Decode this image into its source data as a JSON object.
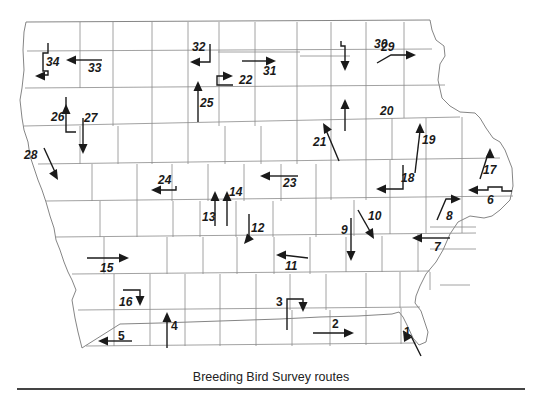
{
  "caption": "Breeding Bird Survey routes",
  "colors": {
    "route": "#1a1a1a",
    "county_line": "#8a8a8a",
    "rule": "#444444"
  },
  "routes": [
    {
      "id": "1",
      "label": "1",
      "label_pos": [
        404,
        336
      ],
      "path": "M421,356 L411,336 L403,331",
      "arrow_at": [
        403,
        331
      ],
      "arrow_dir": "up-left"
    },
    {
      "id": "2",
      "label": "2",
      "label_pos": [
        332,
        328
      ],
      "path": "M313,333 L348,333",
      "arrow_at": [
        354,
        333
      ],
      "arrow_dir": "right"
    },
    {
      "id": "3",
      "label": "3",
      "label_pos": [
        276,
        306
      ],
      "path": "M287,330 L287,299 L303,299 L303,306",
      "arrow_at": [
        303,
        312
      ],
      "arrow_dir": "down"
    },
    {
      "id": "4",
      "label": "4",
      "label_pos": [
        171,
        330
      ],
      "path": "M167,348 L167,318",
      "arrow_at": [
        167,
        312
      ],
      "arrow_dir": "up"
    },
    {
      "id": "5",
      "label": "5",
      "label_pos": [
        118,
        340
      ],
      "path": "M132,341 L104,341",
      "arrow_at": [
        98,
        341
      ],
      "arrow_dir": "left"
    },
    {
      "id": "6",
      "label": "6",
      "label_pos": [
        487,
        204
      ],
      "path": "M512,191 L502,191 L502,187 L488,187 L488,190 L475,190",
      "arrow_at": [
        468,
        190
      ],
      "arrow_dir": "left"
    },
    {
      "id": "7",
      "label": "7",
      "label_pos": [
        434,
        251
      ],
      "path": "M450,238 L418,238",
      "arrow_at": [
        412,
        238
      ],
      "arrow_dir": "left"
    },
    {
      "id": "8",
      "label": "8",
      "label_pos": [
        446,
        220
      ],
      "path": "M437,220 L446,199 L455,199",
      "arrow_at": [
        461,
        199
      ],
      "arrow_dir": "right"
    },
    {
      "id": "9",
      "label": "9",
      "label_pos": [
        341,
        234
      ],
      "path": "M351,218 L351,254",
      "arrow_at": [
        351,
        261
      ],
      "arrow_dir": "down"
    },
    {
      "id": "10",
      "label": "10",
      "label_pos": [
        368,
        220
      ],
      "path": "M358,210 L371,233",
      "arrow_at": [
        374,
        239
      ],
      "arrow_dir": "down-right"
    },
    {
      "id": "11",
      "label": "11",
      "label_pos": [
        285,
        270
      ],
      "path": "M308,258 L283,255",
      "arrow_at": [
        276,
        255
      ],
      "arrow_dir": "left"
    },
    {
      "id": "12",
      "label": "12",
      "label_pos": [
        251,
        232
      ],
      "path": "M249,214 L249,238",
      "arrow_at": [
        244,
        244
      ],
      "arrow_dir": "down-left"
    },
    {
      "id": "13",
      "label": "13",
      "label_pos": [
        202,
        221
      ],
      "path": "M215,226 L215,197",
      "arrow_at": [
        215,
        191
      ],
      "arrow_dir": "up"
    },
    {
      "id": "14",
      "label": "14",
      "label_pos": [
        229,
        196
      ],
      "path": "M227,226 L227,197",
      "arrow_at": [
        227,
        191
      ],
      "arrow_dir": "up"
    },
    {
      "id": "15",
      "label": "15",
      "label_pos": [
        100,
        272
      ],
      "path": "M87,258 L123,258",
      "arrow_at": [
        129,
        258
      ],
      "arrow_dir": "right"
    },
    {
      "id": "16",
      "label": "16",
      "label_pos": [
        119,
        306
      ],
      "path": "M123,290 L140,290 L140,299",
      "arrow_at": [
        140,
        306
      ],
      "arrow_dir": "down"
    },
    {
      "id": "17",
      "label": "17",
      "label_pos": [
        483,
        174
      ],
      "path": "M480,179 L488,154",
      "arrow_at": [
        490,
        148
      ],
      "arrow_dir": "up"
    },
    {
      "id": "18",
      "label": "18",
      "label_pos": [
        401,
        182
      ],
      "path": "M403,165 L403,189 L384,189",
      "arrow_at": [
        376,
        189
      ],
      "arrow_dir": "left"
    },
    {
      "id": "19",
      "label": "19",
      "label_pos": [
        422,
        144
      ],
      "path": "M415,173 L420,131",
      "arrow_at": [
        420,
        123
      ],
      "arrow_dir": "up"
    },
    {
      "id": "20",
      "label": "20",
      "label_pos": [
        380,
        115
      ],
      "path": "M345,131 L345,106",
      "arrow_at": [
        345,
        99
      ],
      "arrow_dir": "up"
    },
    {
      "id": "21",
      "label": "21",
      "label_pos": [
        313,
        146
      ],
      "path": "M339,161 L326,130",
      "arrow_at": [
        323,
        123
      ],
      "arrow_dir": "up-left"
    },
    {
      "id": "22",
      "label": "22",
      "label_pos": [
        239,
        84
      ],
      "path": "M233,85 L217,85 L217,76 L226,76",
      "arrow_at": [
        233,
        76
      ],
      "arrow_dir": "right"
    },
    {
      "id": "23",
      "label": "23",
      "label_pos": [
        283,
        187
      ],
      "path": "M298,176 L266,176",
      "arrow_at": [
        260,
        176
      ],
      "arrow_dir": "left"
    },
    {
      "id": "24",
      "label": "24",
      "label_pos": [
        158,
        184
      ],
      "path": "M176,186 L176,190 L157,190",
      "arrow_at": [
        151,
        190
      ],
      "arrow_dir": "left"
    },
    {
      "id": "25",
      "label": "25",
      "label_pos": [
        200,
        107
      ],
      "path": "M198,122 L198,88",
      "arrow_at": [
        198,
        81
      ],
      "arrow_dir": "up"
    },
    {
      "id": "26",
      "label": "26",
      "label_pos": [
        51,
        121
      ],
      "path": "M66,97 L66,132 L76,132",
      "arrow_at": [
        66,
        104
      ],
      "arrow_dir": "up"
    },
    {
      "id": "27",
      "label": "27",
      "label_pos": [
        84,
        122
      ],
      "path": "M83,118 L83,148",
      "arrow_at": [
        83,
        154
      ],
      "arrow_dir": "down"
    },
    {
      "id": "28",
      "label": "28",
      "label_pos": [
        24,
        159
      ],
      "path": "M44,148 L55,172",
      "arrow_at": [
        58,
        180
      ],
      "arrow_dir": "down-right"
    },
    {
      "id": "29",
      "label": "29",
      "label_pos": [
        381,
        51
      ],
      "path": "M377,63 L391,55 L409,55",
      "arrow_at": [
        416,
        55
      ],
      "arrow_dir": "right"
    },
    {
      "id": "30",
      "label": "30",
      "label_pos": [
        374,
        48
      ],
      "path": "M341,41 L341,46 L345,46 L345,64",
      "arrow_at": [
        345,
        71
      ],
      "arrow_dir": "down"
    },
    {
      "id": "31",
      "label": "31",
      "label_pos": [
        263,
        75
      ],
      "path": "M242,61 L269,61",
      "arrow_at": [
        276,
        61
      ],
      "arrow_dir": "right"
    },
    {
      "id": "32",
      "label": "32",
      "label_pos": [
        192,
        51
      ],
      "path": "M210,44 L210,62 L197,62",
      "arrow_at": [
        190,
        62
      ],
      "arrow_dir": "left"
    },
    {
      "id": "33",
      "label": "33",
      "label_pos": [
        88,
        72
      ],
      "path": "M102,60 L72,60",
      "arrow_at": [
        66,
        60
      ],
      "arrow_dir": "left"
    },
    {
      "id": "34",
      "label": "34",
      "label_pos": [
        46,
        66
      ],
      "path": "M48,43 L48,53 L43,53 L43,71 L48,71 L48,75 L42,75",
      "arrow_at": [
        35,
        76
      ],
      "arrow_dir": "left"
    }
  ]
}
